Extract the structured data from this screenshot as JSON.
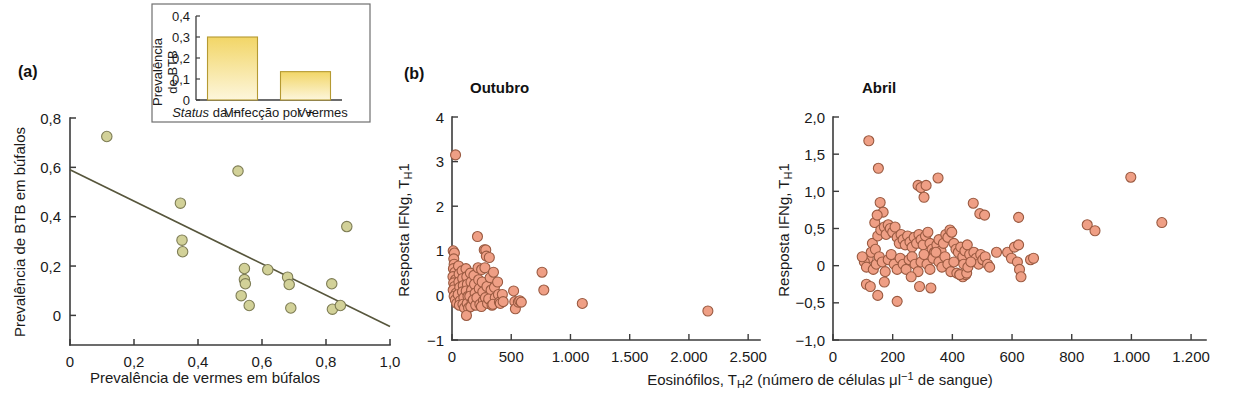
{
  "figure": {
    "panels": [
      {
        "label": "(a)"
      },
      {
        "label": "(b)"
      }
    ]
  },
  "colors": {
    "dot_a_fill": "#d2d198",
    "dot_a_stroke": "#7e7d55",
    "dot_b_fill": "#ef9f85",
    "dot_b_stroke": "#9a5a41",
    "bar_top": "#f2d667",
    "bar_bottom": "#fdf6dc",
    "bar_stroke": "#b59a32",
    "axis": "#3b3b3b",
    "trend": "#57563c",
    "background": "#ffffff"
  },
  "panel_a": {
    "label": "(a)",
    "xlabel": "Prevalência de vermes em búfalos",
    "ylabel": "Prevalência de BTB em búfalos",
    "xticks": [
      "0",
      "0,2",
      "0,4",
      "0,6",
      "0,8",
      "1,0"
    ],
    "yticks": [
      "0",
      "0,2",
      "0,4",
      "0,6",
      "0,8"
    ]
  },
  "inset": {
    "ylabel_line1": "Prevalência",
    "ylabel_line2": "de BTB",
    "xlabel_italic": "Status",
    "xlabel_rest": " da infecção por vermes",
    "yticks": [
      "0",
      "0,1",
      "0,2",
      "0,3",
      "0,4"
    ],
    "categories": [
      "V−",
      "V+"
    ],
    "values": [
      0.3,
      0.135
    ]
  },
  "panel_b": {
    "label": "(b)",
    "titles": [
      "Outubro",
      "Abril"
    ],
    "ylabel": "Resposta IFNg, T",
    "ylabel_sub": "H",
    "ylabel_tail": "1",
    "xlabel_pre": "Eosinófilos, T",
    "xlabel_sub": "H",
    "xlabel_post": "2 (número de células μl",
    "xlabel_sup": "−1",
    "xlabel_end": " de sangue)",
    "outubro": {
      "xticks": [
        "0",
        "500",
        "1.000",
        "1.500",
        "2.000",
        "2.500"
      ],
      "yticks": [
        "-1",
        "0",
        "1",
        "2",
        "3",
        "4"
      ]
    },
    "abril": {
      "xticks": [
        "0",
        "200",
        "400",
        "600",
        "800",
        "1.000",
        "1.200"
      ],
      "yticks": [
        "-1,0",
        "-0,5",
        "0",
        "0,5",
        "1,0",
        "1,5",
        "2,0"
      ]
    }
  },
  "chart_data": [
    {
      "type": "scatter",
      "id": "panel-a-scatter",
      "title": "",
      "xlabel": "Prevalência de vermes em búfalos",
      "ylabel": "Prevalência de BTB em búfalos",
      "xlim": [
        0,
        1.0
      ],
      "ylim": [
        -0.12,
        0.8
      ],
      "xticks": [
        0,
        0.2,
        0.4,
        0.6,
        0.8,
        1.0
      ],
      "yticks": [
        0,
        0.2,
        0.4,
        0.6,
        0.8
      ],
      "grid": false,
      "legend": "none",
      "points": [
        [
          0.115,
          0.725
        ],
        [
          0.345,
          0.455
        ],
        [
          0.35,
          0.305
        ],
        [
          0.352,
          0.258
        ],
        [
          0.525,
          0.585
        ],
        [
          0.535,
          0.08
        ],
        [
          0.545,
          0.19
        ],
        [
          0.545,
          0.145
        ],
        [
          0.548,
          0.128
        ],
        [
          0.56,
          0.04
        ],
        [
          0.618,
          0.185
        ],
        [
          0.68,
          0.155
        ],
        [
          0.685,
          0.125
        ],
        [
          0.69,
          0.03
        ],
        [
          0.818,
          0.128
        ],
        [
          0.82,
          0.025
        ],
        [
          0.845,
          0.04
        ],
        [
          0.865,
          0.36
        ]
      ],
      "trend_line": {
        "x": [
          0,
          1.0
        ],
        "y": [
          0.59,
          -0.045
        ]
      }
    },
    {
      "type": "bar",
      "id": "inset-bar",
      "title": "",
      "xlabel": "Status da infecção por vermes",
      "ylabel": "Prevalência de BTB",
      "categories": [
        "V−",
        "V+"
      ],
      "values": [
        0.3,
        0.135
      ],
      "ylim": [
        0,
        0.4
      ],
      "yticks": [
        0,
        0.1,
        0.2,
        0.3,
        0.4
      ],
      "grid": false,
      "legend": "none"
    },
    {
      "type": "scatter",
      "id": "outubro-scatter",
      "title": "Outubro",
      "xlabel": "Eosinófilos, TH2 (número de células μl−1 de sangue)",
      "ylabel": "Resposta IFNg, TH1",
      "xlim": [
        0,
        2600
      ],
      "ylim": [
        -1,
        4
      ],
      "xticks": [
        0,
        500,
        1000,
        1500,
        2000,
        2500
      ],
      "yticks": [
        -1,
        0,
        1,
        2,
        3,
        4
      ],
      "grid": false,
      "legend": "none",
      "points": [
        [
          30,
          3.15
        ],
        [
          10,
          1.0
        ],
        [
          20,
          0.95
        ],
        [
          15,
          0.82
        ],
        [
          18,
          0.7
        ],
        [
          12,
          0.6
        ],
        [
          25,
          0.52
        ],
        [
          8,
          0.42
        ],
        [
          30,
          0.35
        ],
        [
          14,
          0.28
        ],
        [
          22,
          0.2
        ],
        [
          10,
          0.12
        ],
        [
          35,
          0.05
        ],
        [
          18,
          -0.02
        ],
        [
          28,
          -0.1
        ],
        [
          40,
          -0.18
        ],
        [
          55,
          0.66
        ],
        [
          60,
          0.48
        ],
        [
          58,
          0.3
        ],
        [
          65,
          0.18
        ],
        [
          52,
          0.02
        ],
        [
          70,
          -0.12
        ],
        [
          62,
          -0.22
        ],
        [
          85,
          0.55
        ],
        [
          90,
          0.38
        ],
        [
          95,
          0.22
        ],
        [
          88,
          0.08
        ],
        [
          100,
          -0.05
        ],
        [
          92,
          -0.2
        ],
        [
          105,
          -0.28
        ],
        [
          118,
          0.6
        ],
        [
          125,
          0.42
        ],
        [
          130,
          0.25
        ],
        [
          120,
          0.1
        ],
        [
          135,
          -0.02
        ],
        [
          128,
          -0.18
        ],
        [
          140,
          -0.28
        ],
        [
          122,
          -0.45
        ],
        [
          155,
          0.5
        ],
        [
          160,
          0.3
        ],
        [
          165,
          0.12
        ],
        [
          150,
          -0.02
        ],
        [
          170,
          -0.15
        ],
        [
          158,
          -0.25
        ],
        [
          185,
          0.45
        ],
        [
          190,
          0.25
        ],
        [
          195,
          0.05
        ],
        [
          180,
          -0.1
        ],
        [
          200,
          -0.22
        ],
        [
          215,
          1.32
        ],
        [
          220,
          0.62
        ],
        [
          225,
          0.35
        ],
        [
          230,
          0.15
        ],
        [
          210,
          -0.05
        ],
        [
          235,
          -0.2
        ],
        [
          250,
          0.58
        ],
        [
          255,
          0.3
        ],
        [
          260,
          0.08
        ],
        [
          265,
          -0.12
        ],
        [
          248,
          -0.25
        ],
        [
          272,
          1.02
        ],
        [
          285,
          1.02
        ],
        [
          290,
          0.88
        ],
        [
          278,
          0.62
        ],
        [
          295,
          0.2
        ],
        [
          282,
          -0.05
        ],
        [
          300,
          -0.18
        ],
        [
          315,
          0.85
        ],
        [
          322,
          0.4
        ],
        [
          330,
          0.12
        ],
        [
          310,
          -0.08
        ],
        [
          338,
          -0.22
        ],
        [
          350,
          0.52
        ],
        [
          358,
          0.18
        ],
        [
          365,
          -0.05
        ],
        [
          345,
          -0.2
        ],
        [
          385,
          0.3
        ],
        [
          392,
          0.02
        ],
        [
          400,
          -0.15
        ],
        [
          408,
          -0.18
        ],
        [
          425,
          0.02
        ],
        [
          432,
          -0.14
        ],
        [
          520,
          0.1
        ],
        [
          530,
          -0.14
        ],
        [
          535,
          -0.3
        ],
        [
          560,
          -0.15
        ],
        [
          572,
          -0.12
        ],
        [
          585,
          -0.15
        ],
        [
          760,
          0.52
        ],
        [
          775,
          0.12
        ],
        [
          1100,
          -0.18
        ],
        [
          2160,
          -0.35
        ]
      ]
    },
    {
      "type": "scatter",
      "id": "abril-scatter",
      "title": "Abril",
      "xlabel": "Eosinófilos, TH2 (número de células μl−1 de sangue)",
      "ylabel": "Resposta IFNg, TH1",
      "xlim": [
        0,
        1250
      ],
      "ylim": [
        -1.0,
        2.0
      ],
      "xticks": [
        0,
        200,
        400,
        600,
        800,
        1000,
        1200
      ],
      "yticks": [
        -1.0,
        -0.5,
        0,
        0.5,
        1.0,
        1.5,
        2.0
      ],
      "grid": false,
      "legend": "none",
      "points": [
        [
          120,
          1.68
        ],
        [
          152,
          1.31
        ],
        [
          285,
          1.08
        ],
        [
          295,
          1.05
        ],
        [
          312,
          1.08
        ],
        [
          352,
          1.18
        ],
        [
          305,
          0.92
        ],
        [
          158,
          0.85
        ],
        [
          168,
          0.72
        ],
        [
          140,
          0.58
        ],
        [
          148,
          0.68
        ],
        [
          470,
          0.84
        ],
        [
          492,
          0.7
        ],
        [
          508,
          0.68
        ],
        [
          622,
          0.65
        ],
        [
          852,
          0.55
        ],
        [
          878,
          0.47
        ],
        [
          998,
          1.19
        ],
        [
          1102,
          0.58
        ],
        [
          118,
          0.1
        ],
        [
          105,
          0.05
        ],
        [
          128,
          0.18
        ],
        [
          98,
          0.12
        ],
        [
          112,
          -0.02
        ],
        [
          132,
          0.3
        ],
        [
          142,
          0.22
        ],
        [
          150,
          0.4
        ],
        [
          160,
          0.48
        ],
        [
          172,
          0.52
        ],
        [
          178,
          0.42
        ],
        [
          185,
          0.55
        ],
        [
          192,
          0.5
        ],
        [
          200,
          0.45
        ],
        [
          208,
          0.52
        ],
        [
          215,
          0.38
        ],
        [
          222,
          0.3
        ],
        [
          228,
          0.42
        ],
        [
          235,
          0.35
        ],
        [
          242,
          0.28
        ],
        [
          250,
          0.4
        ],
        [
          258,
          0.32
        ],
        [
          265,
          0.25
        ],
        [
          272,
          0.38
        ],
        [
          280,
          0.3
        ],
        [
          288,
          0.42
        ],
        [
          295,
          0.35
        ],
        [
          302,
          0.28
        ],
        [
          310,
          0.4
        ],
        [
          318,
          0.45
        ],
        [
          325,
          0.3
        ],
        [
          332,
          0.22
        ],
        [
          340,
          0.18
        ],
        [
          348,
          0.28
        ],
        [
          355,
          0.35
        ],
        [
          362,
          0.2
        ],
        [
          370,
          0.3
        ],
        [
          378,
          0.42
        ],
        [
          385,
          0.38
        ],
        [
          392,
          0.48
        ],
        [
          398,
          0.45
        ],
        [
          405,
          0.3
        ],
        [
          412,
          0.22
        ],
        [
          420,
          0.18
        ],
        [
          428,
          0.25
        ],
        [
          435,
          0.12
        ],
        [
          442,
          0.2
        ],
        [
          450,
          0.28
        ],
        [
          458,
          0.15
        ],
        [
          465,
          0.05
        ],
        [
          472,
          0.18
        ],
        [
          480,
          0.1
        ],
        [
          488,
          0.02
        ],
        [
          495,
          0.15
        ],
        [
          502,
          0.08
        ],
        [
          510,
          0.12
        ],
        [
          518,
          0.02
        ],
        [
          525,
          -0.02
        ],
        [
          135,
          -0.05
        ],
        [
          145,
          0.02
        ],
        [
          155,
          0.12
        ],
        [
          165,
          0.05
        ],
        [
          175,
          -0.08
        ],
        [
          185,
          0.08
        ],
        [
          195,
          0.15
        ],
        [
          205,
          0.02
        ],
        [
          215,
          -0.05
        ],
        [
          225,
          0.1
        ],
        [
          235,
          0.02
        ],
        [
          245,
          -0.05
        ],
        [
          255,
          0.08
        ],
        [
          265,
          0.12
        ],
        [
          275,
          0.02
        ],
        [
          285,
          -0.08
        ],
        [
          295,
          0.05
        ],
        [
          305,
          0.15
        ],
        [
          315,
          0.02
        ],
        [
          325,
          -0.05
        ],
        [
          335,
          0.1
        ],
        [
          345,
          0.18
        ],
        [
          355,
          0.05
        ],
        [
          365,
          -0.02
        ],
        [
          375,
          0.12
        ],
        [
          385,
          0.02
        ],
        [
          395,
          -0.08
        ],
        [
          405,
          0.05
        ],
        [
          415,
          -0.1
        ],
        [
          425,
          -0.12
        ],
        [
          435,
          -0.15
        ],
        [
          445,
          -0.12
        ],
        [
          112,
          -0.25
        ],
        [
          125,
          -0.28
        ],
        [
          150,
          -0.4
        ],
        [
          172,
          -0.22
        ],
        [
          215,
          -0.48
        ],
        [
          262,
          -0.15
        ],
        [
          290,
          -0.28
        ],
        [
          328,
          -0.3
        ],
        [
          425,
          -0.12
        ],
        [
          448,
          -0.1
        ],
        [
          548,
          0.18
        ],
        [
          585,
          0.18
        ],
        [
          598,
          0.1
        ],
        [
          608,
          0.25
        ],
        [
          618,
          0.05
        ],
        [
          625,
          -0.05
        ],
        [
          630,
          -0.15
        ],
        [
          622,
          0.28
        ],
        [
          662,
          0.08
        ],
        [
          672,
          0.1
        ],
        [
          438,
          0.02
        ],
        [
          452,
          -0.02
        ],
        [
          462,
          0.05
        ]
      ]
    }
  ]
}
